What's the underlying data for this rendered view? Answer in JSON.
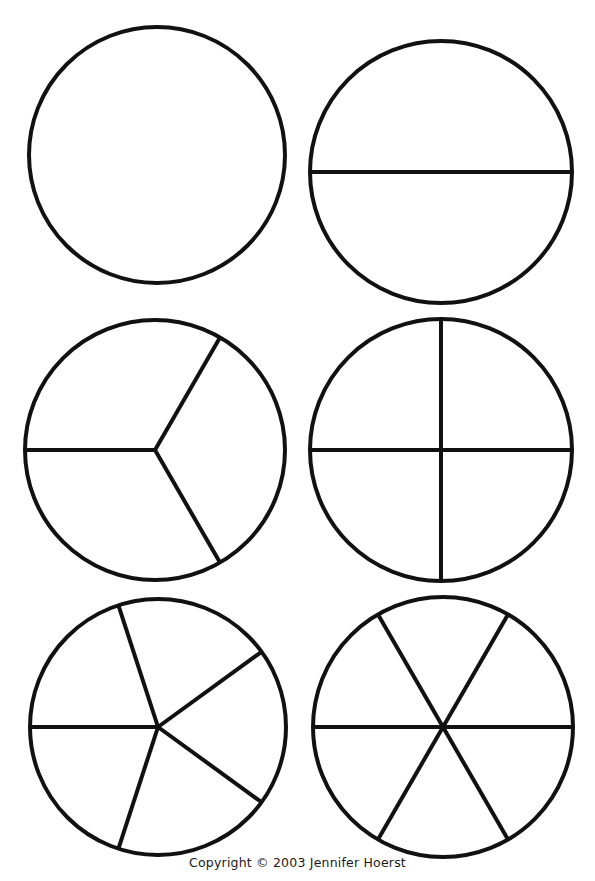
{
  "page": {
    "type": "fraction-circles-worksheet",
    "background_color": "#ffffff",
    "line_color": "#111111",
    "width": 595,
    "height": 881
  },
  "footer": {
    "copyright_text": "Copyright © 2003 Jennifer Hoerst"
  },
  "chart_data": {
    "type": "pie",
    "title": "",
    "subtitle": "",
    "xlabel": "",
    "ylabel": "",
    "legend_position": "none",
    "grid": false,
    "stroke_color": "#111111",
    "stroke_width": 4,
    "fill_color": "#ffffff",
    "circles": [
      {
        "name": "whole",
        "label": "1 whole",
        "denominator": 1,
        "slice_fraction": "1/1",
        "slice_percent": 100,
        "cx": 157,
        "cy": 155,
        "r": 128,
        "divider_angles_deg": [],
        "divider_type": "none",
        "values": [
          100
        ]
      },
      {
        "name": "halves",
        "label": "halves",
        "denominator": 2,
        "slice_fraction": "1/2",
        "slice_percent": 50,
        "cx": 441,
        "cy": 172,
        "r": 131,
        "divider_angles_deg": [
          0
        ],
        "divider_type": "diameter",
        "values": [
          50,
          50
        ]
      },
      {
        "name": "thirds",
        "label": "thirds",
        "denominator": 3,
        "slice_fraction": "1/3",
        "slice_percent": 33.3,
        "cx": 155,
        "cy": 450,
        "r": 130,
        "divider_angles_deg": [
          180,
          60,
          300
        ],
        "divider_type": "radius",
        "values": [
          33.3,
          33.3,
          33.3
        ]
      },
      {
        "name": "fourths",
        "label": "fourths",
        "denominator": 4,
        "slice_fraction": "1/4",
        "slice_percent": 25,
        "cx": 441,
        "cy": 450,
        "r": 131,
        "divider_angles_deg": [
          0,
          90
        ],
        "divider_type": "diameter",
        "values": [
          25,
          25,
          25,
          25
        ]
      },
      {
        "name": "fifths",
        "label": "fifths",
        "denominator": 5,
        "slice_fraction": "1/5",
        "slice_percent": 20,
        "cx": 158,
        "cy": 727,
        "r": 128,
        "divider_angles_deg": [
          180,
          108,
          36,
          324,
          252
        ],
        "divider_type": "radius",
        "values": [
          20,
          20,
          20,
          20,
          20
        ]
      },
      {
        "name": "sixths",
        "label": "sixths",
        "denominator": 6,
        "slice_fraction": "1/6",
        "slice_percent": 16.7,
        "cx": 443,
        "cy": 727,
        "r": 130,
        "divider_angles_deg": [
          0,
          60,
          120
        ],
        "divider_type": "diameter",
        "values": [
          16.7,
          16.7,
          16.7,
          16.7,
          16.7,
          16.7
        ]
      }
    ]
  }
}
